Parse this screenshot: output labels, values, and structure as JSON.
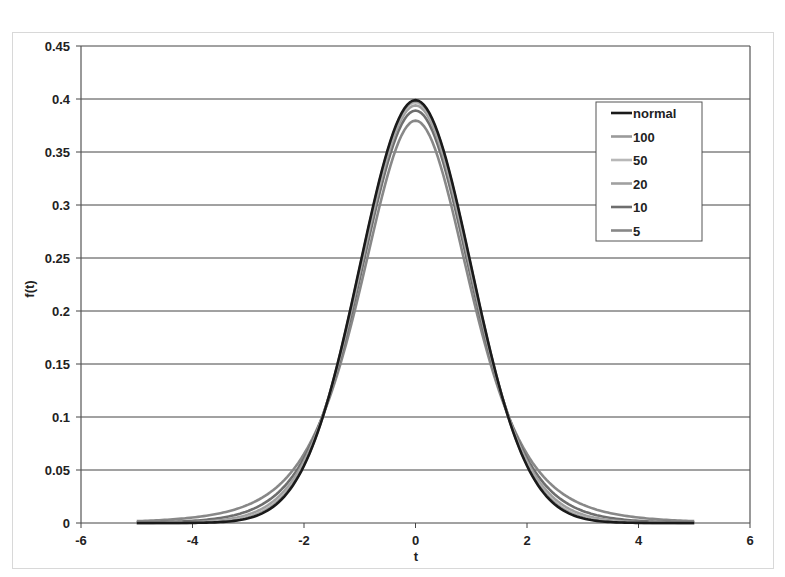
{
  "chart_data": {
    "type": "line",
    "title": "",
    "xlabel": "t",
    "ylabel": "f(t)",
    "xlim": [
      -6,
      6
    ],
    "ylim": [
      0,
      0.45
    ],
    "x_ticks": [
      "-6",
      "-4",
      "-2",
      "0",
      "2",
      "4",
      "6"
    ],
    "y_ticks": [
      "0",
      "0.05",
      "0.1",
      "0.15",
      "0.2",
      "0.25",
      "0.3",
      "0.35",
      "0.4",
      "0.45"
    ],
    "grid": "horizontal major gridlines",
    "legend_position": "upper right inside plot",
    "x_range_of_series": [
      -5,
      5
    ],
    "series": [
      {
        "name": "normal",
        "df": null,
        "color": "#1a1a1a",
        "peak": 0.399
      },
      {
        "name": "100",
        "df": 100,
        "color": "#9a9a9a",
        "peak": 0.398
      },
      {
        "name": "50",
        "df": 50,
        "color": "#b8b8b8",
        "peak": 0.397
      },
      {
        "name": "20",
        "df": 20,
        "color": "#a0a0a0",
        "peak": 0.394
      },
      {
        "name": "10",
        "df": 10,
        "color": "#6e6e6e",
        "peak": 0.389
      },
      {
        "name": "5",
        "df": 5,
        "color": "#888888",
        "peak": 0.38
      }
    ],
    "sample_points": {
      "x": [
        -5,
        -4,
        -3,
        -2,
        -1,
        0,
        1,
        2,
        3,
        4,
        5
      ],
      "normal": [
        1.5e-06,
        0.00013,
        0.0044,
        0.054,
        0.242,
        0.399,
        0.242,
        0.054,
        0.0044,
        0.00013,
        1.5e-06
      ],
      "5": [
        0.0018,
        0.0051,
        0.0173,
        0.0651,
        0.2197,
        0.3796,
        0.2197,
        0.0651,
        0.0173,
        0.0051,
        0.0018
      ]
    }
  },
  "legend": {
    "items": [
      "normal",
      "100",
      "50",
      "20",
      "10",
      "5"
    ]
  }
}
